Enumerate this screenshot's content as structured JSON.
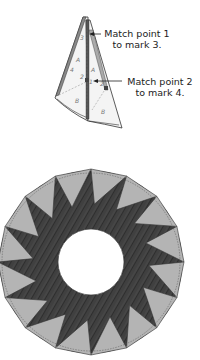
{
  "diagram": {
    "type": "quilt-piecing-instructions",
    "callouts": [
      {
        "line1": "Match point 1",
        "line2": "to mark 3."
      },
      {
        "line1": "Match point 2",
        "line2": "to mark 4."
      }
    ],
    "wedge_marks": {
      "left_piece": [
        "3",
        "A",
        "4",
        "2",
        "B"
      ],
      "right_piece": [
        "A",
        "1",
        "2",
        "B"
      ]
    },
    "ring": {
      "points": 16,
      "colors": {
        "triangles": "#b4b4b4",
        "streaks": "#3a3a3a",
        "outline": "#333333"
      }
    }
  }
}
